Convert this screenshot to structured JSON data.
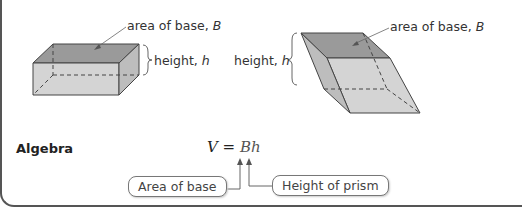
{
  "figures": {
    "right_prism": {
      "base_label": "area of base, ",
      "base_var": "B",
      "height_label": "height, ",
      "height_var": "h"
    },
    "oblique_prism": {
      "base_label": "area of base, ",
      "base_var": "B",
      "height_label": "height, ",
      "height_var": "h"
    }
  },
  "algebra": {
    "heading": "Algebra",
    "formula_lhs": "V = ",
    "formula_rhs": "Bh",
    "callout_base": "Area of base",
    "callout_height": "Height of prism"
  },
  "colors": {
    "top_face": "#9a9a9a",
    "front_face": "#d4d4d4",
    "side_face": "#b8b8b8",
    "edge": "#444444"
  }
}
